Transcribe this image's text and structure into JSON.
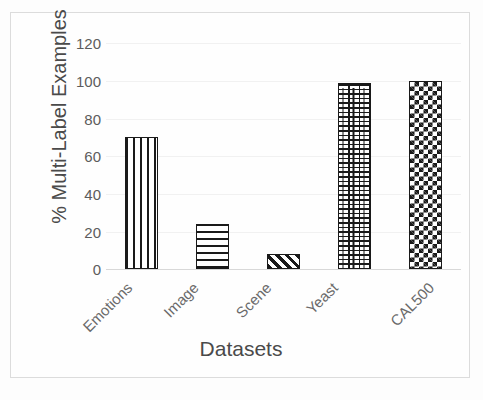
{
  "chart_data": {
    "type": "bar",
    "title": "",
    "subtitle": "",
    "xlabel": "Datasets",
    "ylabel": "% Multi-Label Examples",
    "categories": [
      "Emotions",
      "Image",
      "Scene",
      "Yeast",
      "CAL500"
    ],
    "values": [
      70,
      24,
      8,
      99,
      100
    ],
    "series": [
      {
        "name": "% Multi-Label Examples",
        "values": [
          70,
          24,
          8,
          99,
          100
        ]
      }
    ],
    "bar_patterns": [
      "vertical-stripes",
      "horizontal-stripes",
      "diagonal-stripes",
      "brick",
      "checkerboard"
    ],
    "ylim": [
      0,
      120
    ],
    "yticks": [
      0,
      20,
      40,
      60,
      80,
      100,
      120
    ],
    "ytick_labels": [
      "0",
      "20",
      "40",
      "60",
      "80",
      "100",
      "120"
    ],
    "xlim": [
      0,
      5
    ],
    "grid": true,
    "grid_axis": "y",
    "legend": false,
    "legend_position": "none",
    "xtick_rotation": -45,
    "colors": {
      "bar_outline": "#1a1a1a",
      "bar_fill": "#ffffff",
      "gridline": "#f1f1f1",
      "axis": "#d8d8d8",
      "tick_text": "#5c5c5c",
      "axis_title": "#4a4a4a",
      "frame_border": "#dcdcdc",
      "background": "#fdfdfd"
    }
  }
}
